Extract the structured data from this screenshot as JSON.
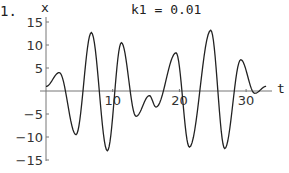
{
  "panel_label": "1.",
  "chart_data": {
    "type": "line",
    "title": "k1 = 0.01",
    "xlabel": "t",
    "ylabel": "x",
    "xlim": [
      0,
      34
    ],
    "ylim": [
      -15,
      15
    ],
    "xticks": [
      10,
      20,
      30
    ],
    "yticks": [
      15,
      10,
      5,
      -5,
      -10,
      -15
    ],
    "grid": false,
    "legend": null,
    "series": [
      {
        "name": "x(t)",
        "x": [
          0,
          2,
          4.5,
          6.8,
          9.2,
          11.3,
          13.5,
          15.5,
          16.5,
          19.5,
          21.5,
          24.7,
          26.8,
          29.2,
          31.3,
          33
        ],
        "y": [
          1,
          4,
          -9.5,
          12.7,
          -13,
          10.5,
          -5.5,
          -1,
          -3.5,
          8.3,
          -12.2,
          13.2,
          -12.5,
          6.8,
          -0.5,
          1
        ]
      }
    ]
  },
  "axes": {
    "x_tick_labels": [
      "10",
      "20",
      "30"
    ],
    "y_tick_labels": [
      "15",
      "10",
      "5",
      "-5",
      "-10",
      "-15"
    ]
  }
}
